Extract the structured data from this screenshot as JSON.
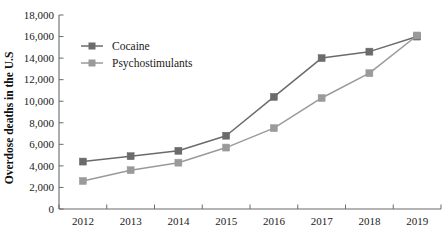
{
  "chart_data": {
    "type": "line",
    "title": "",
    "xlabel": "",
    "ylabel": "Overdose deaths in the U.S",
    "categories": [
      "2012",
      "2013",
      "2014",
      "2015",
      "2016",
      "2017",
      "2018",
      "2019"
    ],
    "x": [
      2012,
      2013,
      2014,
      2015,
      2016,
      2017,
      2018,
      2019
    ],
    "series": [
      {
        "name": "Cocaine",
        "color": "#6b6b6b",
        "marker": "square",
        "values": [
          4400,
          4900,
          5400,
          6800,
          10400,
          14000,
          14600,
          16000
        ]
      },
      {
        "name": "Psychostimulants",
        "color": "#9a9a9a",
        "marker": "square",
        "values": [
          2600,
          3600,
          4300,
          5700,
          7500,
          10300,
          12600,
          16100
        ]
      }
    ],
    "ylim": [
      0,
      18000
    ],
    "ytick_step": 2000,
    "ytick_labels": [
      "0",
      "2,000",
      "4,000",
      "6,000",
      "8,000",
      "10,000",
      "12,000",
      "14,000",
      "16,000",
      "18,000"
    ],
    "ytick_values": [
      0,
      2000,
      4000,
      6000,
      8000,
      10000,
      12000,
      14000,
      16000,
      18000
    ],
    "xtick_labels": [
      "2012",
      "2013",
      "2014",
      "2015",
      "2016",
      "2017",
      "2018",
      "2019"
    ],
    "grid": false,
    "legend_position": "upper-left-inside",
    "legend_entries": [
      "Cocaine",
      "Psychostimulants"
    ],
    "annotations": []
  }
}
